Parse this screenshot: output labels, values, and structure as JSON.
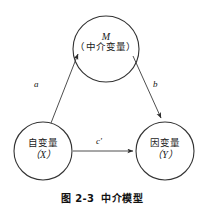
{
  "figure": {
    "caption_number": "图 2-3",
    "caption_title": "中介模型",
    "background_color": "#ffffff",
    "stroke_color": "#333333"
  },
  "nodes": [
    {
      "id": "mediator",
      "variable": "M",
      "name_cn": "（中介变量）",
      "cx": 106,
      "cy": 49,
      "r": 33
    },
    {
      "id": "independent",
      "variable": "（X）",
      "name_cn": "自变量",
      "cx": 43,
      "cy": 151,
      "r": 29
    },
    {
      "id": "dependent",
      "variable": "（Y）",
      "name_cn": "因变量",
      "cx": 165,
      "cy": 151,
      "r": 29
    }
  ],
  "edges": [
    {
      "id": "a",
      "label": "a",
      "from": "independent",
      "to": "mediator"
    },
    {
      "id": "b",
      "label": "b",
      "from": "mediator",
      "to": "dependent"
    },
    {
      "id": "c-prime",
      "label": "c'",
      "from": "independent",
      "to": "dependent"
    }
  ]
}
